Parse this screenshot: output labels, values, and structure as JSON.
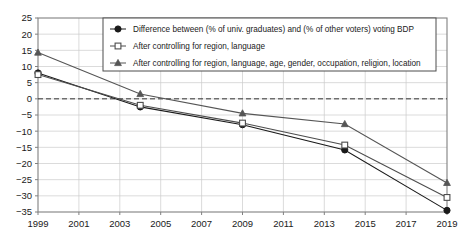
{
  "chart_data": {
    "type": "line",
    "title": "",
    "xlabel": "",
    "ylabel": "",
    "x": [
      1999,
      2004,
      2009,
      2014,
      2019
    ],
    "xlim": [
      1999,
      2019
    ],
    "ylim": [
      -35,
      25
    ],
    "xticks": [
      "1999",
      "2001",
      "2003",
      "2005",
      "2007",
      "2009",
      "2011",
      "2013",
      "2015",
      "2017",
      "2019"
    ],
    "xtick_values": [
      1999,
      2001,
      2003,
      2005,
      2007,
      2009,
      2011,
      2013,
      2015,
      2017,
      2019
    ],
    "yticks": [
      "25",
      "20",
      "15",
      "10",
      "5",
      "0",
      "-5",
      "-10",
      "-15",
      "-20",
      "-25",
      "-30",
      "-35"
    ],
    "ytick_values": [
      25,
      20,
      15,
      10,
      5,
      0,
      -5,
      -10,
      -15,
      -20,
      -25,
      -30,
      -35
    ],
    "grid": true,
    "zero_line": 0,
    "zero_line_style": "dashed",
    "legend_position": "top-center",
    "series": [
      {
        "name": "Difference between (% of univ. graduates) and (% of other voters) voting BDP",
        "marker": "filled-circle",
        "color": "#1a1a1a",
        "values": [
          8,
          -2.5,
          -8,
          -15.8,
          -34.5
        ]
      },
      {
        "name": "After controlling for region, language",
        "marker": "open-square",
        "color": "#4d4d4d",
        "values": [
          7.5,
          -2,
          -7.5,
          -14.3,
          -30.5
        ]
      },
      {
        "name": "After controlling for region, language, age, gender, occupation, religion, location",
        "marker": "filled-triangle",
        "color": "#555555",
        "values": [
          14.3,
          1.5,
          -4.5,
          -7.8,
          -26
        ]
      }
    ]
  },
  "axes": {
    "frame_color": "#808080",
    "grid_color": "#cccccc"
  }
}
